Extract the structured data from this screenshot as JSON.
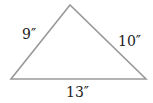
{
  "diagram": {
    "shape": "triangle",
    "sides": {
      "left": "9″",
      "right": "10″",
      "bottom": "13″"
    },
    "colors": {
      "stroke": "#9a9a9a",
      "text": "#222222"
    }
  }
}
